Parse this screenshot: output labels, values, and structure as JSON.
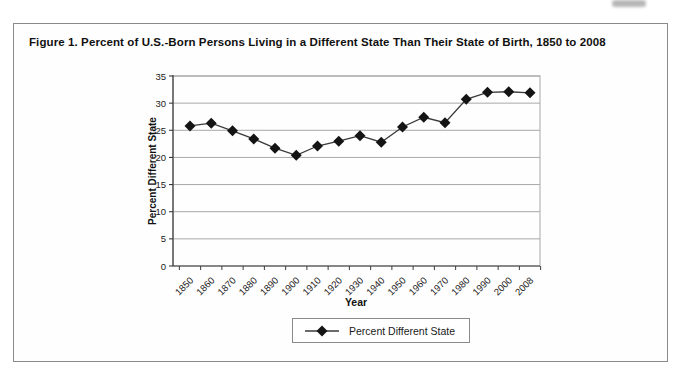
{
  "figure": {
    "title": "Figure 1. Percent of U.S.-Born Persons Living in a Different State Than Their State of Birth, 1850 to 2008"
  },
  "chart_data": {
    "type": "line",
    "title": "Figure 1. Percent of U.S.-Born Persons Living in a Different State Than Their State of Birth, 1850 to 2008",
    "x": [
      "1850",
      "1860",
      "1870",
      "1880",
      "1890",
      "1900",
      "1910",
      "1920",
      "1930",
      "1940",
      "1950",
      "1960",
      "1970",
      "1980",
      "1990",
      "2000",
      "2008"
    ],
    "series": [
      {
        "name": "Percent Different State",
        "marker": "diamond",
        "color": "#141414",
        "values": [
          25.8,
          26.3,
          24.9,
          23.4,
          21.7,
          20.4,
          22.1,
          23.0,
          24.0,
          22.8,
          25.6,
          27.4,
          26.4,
          30.7,
          32.0,
          32.1,
          31.9
        ]
      }
    ],
    "xlabel": "Year",
    "ylabel": "Percent Different State",
    "ylim": [
      0,
      35
    ],
    "yticks": [
      0,
      5,
      10,
      15,
      20,
      25,
      30,
      35
    ],
    "grid": true,
    "legend_position": "bottom",
    "colors": {
      "marker": "#141414",
      "line": "#3a3a3a",
      "grid": "#a8a8a8",
      "axis": "#3c3c3c",
      "border": "#8a8a8a",
      "text": "#1a1a1a"
    }
  }
}
